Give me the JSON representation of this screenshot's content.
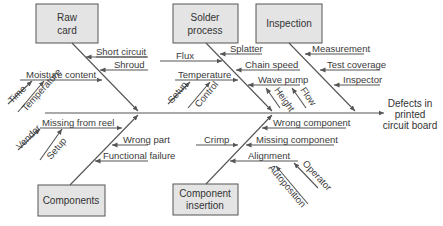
{
  "effect": {
    "line1": "Defects in",
    "line2": "printed",
    "line3": "circuit board"
  },
  "categories": {
    "raw_card": {
      "line1": "Raw",
      "line2": "card",
      "causes": [
        "Short circuit",
        "Shroud",
        "Moisture content"
      ],
      "sub_causes": {
        "moisture_content": [
          "Time",
          "Temperature"
        ]
      }
    },
    "solder_process": {
      "line1": "Solder",
      "line2": "process",
      "causes": [
        "Flux",
        "Splatter",
        "Chain speed",
        "Temperature",
        "Wave pump"
      ],
      "sub_causes": {
        "temperature": [
          "Setup",
          "Control"
        ],
        "wave_pump": [
          "Height",
          "Flow"
        ]
      }
    },
    "inspection": {
      "line1": "Inspection",
      "causes": [
        "Measurement",
        "Test coverage",
        "Inspector"
      ]
    },
    "components": {
      "line1": "Components",
      "causes": [
        "Missing from reel",
        "Wrong part",
        "Functional failure"
      ],
      "sub_causes": {
        "missing_from_reel": [
          "Vendor",
          "Setup"
        ]
      }
    },
    "component_insertion": {
      "line1": "Component",
      "line2": "insertion",
      "causes": [
        "Crimp",
        "Wrong component",
        "Missing component",
        "Alignment"
      ],
      "sub_causes": {
        "alignment": [
          "Operator",
          "Autoposition"
        ]
      }
    }
  }
}
